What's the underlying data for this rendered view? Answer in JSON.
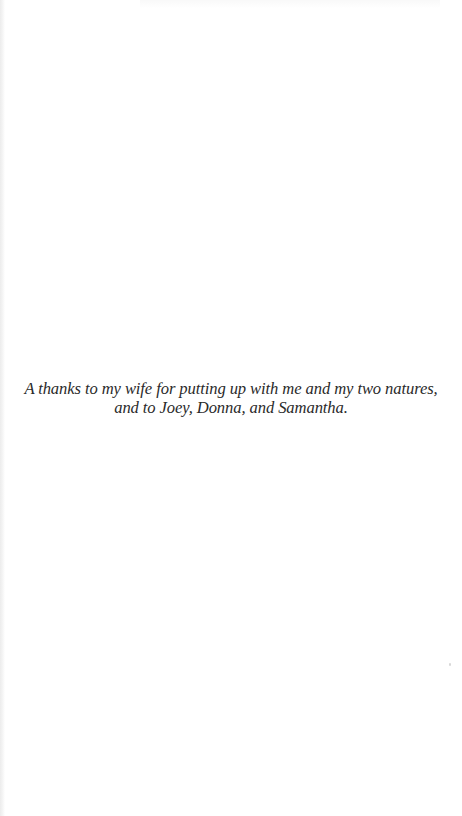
{
  "page": {
    "type": "dedication-page",
    "background_color": "#ffffff",
    "text_color": "#2a2a2a"
  },
  "dedication": {
    "lines": [
      "A thanks to my wife for putting up with me and my two natures,",
      "and to Joey, Donna, and Samantha."
    ]
  }
}
